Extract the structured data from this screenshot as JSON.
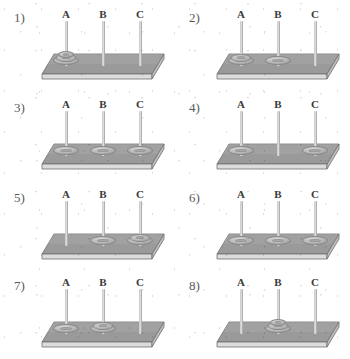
{
  "figure": {
    "peg_labels": [
      "A",
      "B",
      "C"
    ],
    "colors": {
      "background": "#ffffff",
      "base_top": "#9a9a9a",
      "base_front": "#d8d8d8",
      "base_outline": "#6f6f6f",
      "rod": "#c9c9c9",
      "disk": "#b6b6b6",
      "label_text": "#3b3b3b",
      "number_text": "#5a5a5a"
    }
  },
  "panels": [
    {
      "number": "1)",
      "pegs": [
        {
          "label": "A",
          "disks": 3
        },
        {
          "label": "B",
          "disks": 0
        },
        {
          "label": "C",
          "disks": 0
        }
      ]
    },
    {
      "number": "2)",
      "pegs": [
        {
          "label": "A",
          "disks": 2
        },
        {
          "label": "B",
          "disks": 1
        },
        {
          "label": "C",
          "disks": 0
        }
      ]
    },
    {
      "number": "3)",
      "pegs": [
        {
          "label": "A",
          "disks": 1
        },
        {
          "label": "B",
          "disks": 1
        },
        {
          "label": "C",
          "disks": 1
        }
      ]
    },
    {
      "number": "4)",
      "pegs": [
        {
          "label": "A",
          "disks": 1
        },
        {
          "label": "B",
          "disks": 0
        },
        {
          "label": "C",
          "disks": 1
        }
      ]
    },
    {
      "number": "5)",
      "pegs": [
        {
          "label": "A",
          "disks": 0
        },
        {
          "label": "B",
          "disks": 1
        },
        {
          "label": "C",
          "disks": 2
        }
      ]
    },
    {
      "number": "6)",
      "pegs": [
        {
          "label": "A",
          "disks": 1
        },
        {
          "label": "B",
          "disks": 1
        },
        {
          "label": "C",
          "disks": 1
        }
      ]
    },
    {
      "number": "7)",
      "pegs": [
        {
          "label": "A",
          "disks": 1
        },
        {
          "label": "B",
          "disks": 2
        },
        {
          "label": "C",
          "disks": 0
        }
      ]
    },
    {
      "number": "8)",
      "pegs": [
        {
          "label": "A",
          "disks": 0
        },
        {
          "label": "B",
          "disks": 3
        },
        {
          "label": "C",
          "disks": 0
        }
      ]
    }
  ]
}
